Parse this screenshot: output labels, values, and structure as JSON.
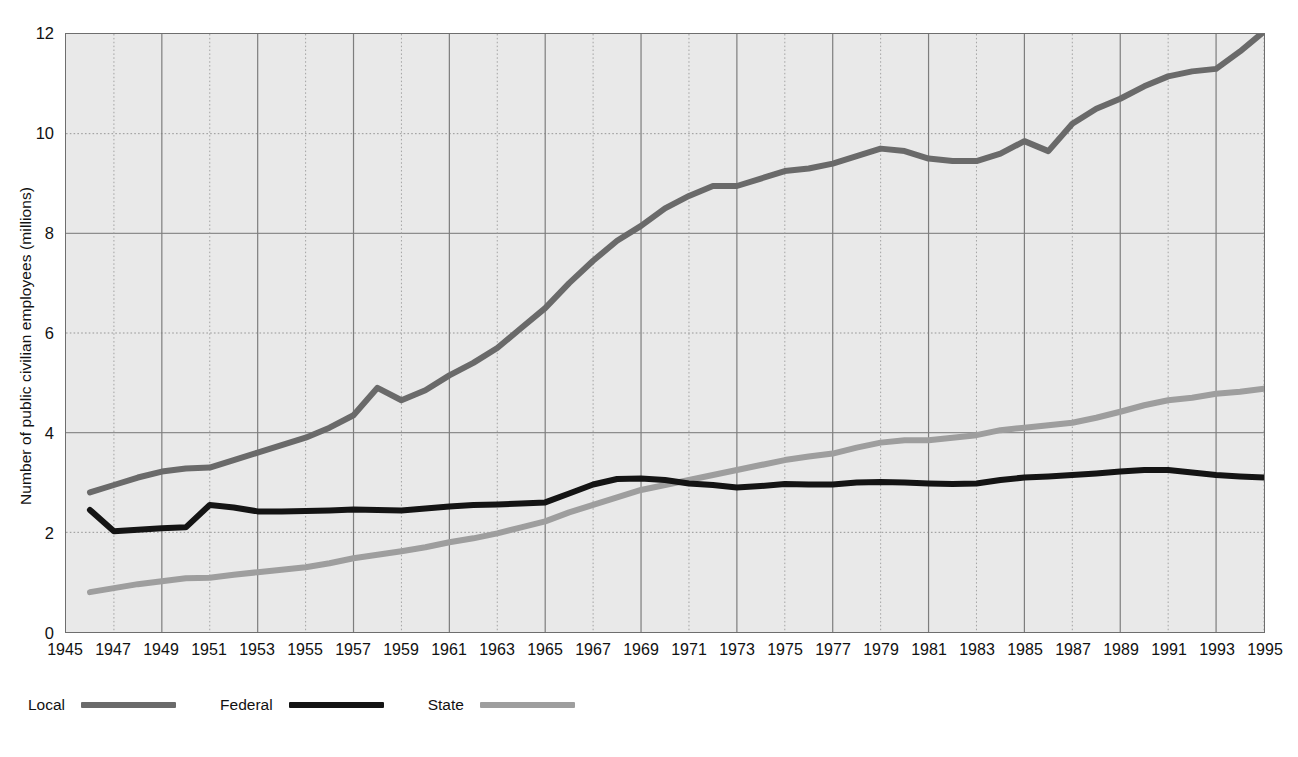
{
  "chart_data": {
    "type": "line",
    "title": "",
    "subtitle": "",
    "xlabel": "",
    "ylabel": "Number of public civilian employees (millions)",
    "xlim": [
      1945,
      1995
    ],
    "ylim": [
      0,
      12
    ],
    "y_ticks": [
      "0",
      "2",
      "4",
      "6",
      "8",
      "10",
      "12"
    ],
    "y_tick_values": [
      0,
      2,
      4,
      6,
      8,
      10,
      12
    ],
    "x_ticks": [
      "1945",
      "1947",
      "1949",
      "1951",
      "1953",
      "1955",
      "1957",
      "1959",
      "1961",
      "1963",
      "1965",
      "1967",
      "1969",
      "1971",
      "1973",
      "1975",
      "1977",
      "1979",
      "1981",
      "1983",
      "1985",
      "1987",
      "1989",
      "1991",
      "1993",
      "1995"
    ],
    "x_tick_values": [
      1945,
      1947,
      1949,
      1951,
      1953,
      1955,
      1957,
      1959,
      1961,
      1963,
      1965,
      1967,
      1969,
      1971,
      1973,
      1975,
      1977,
      1979,
      1981,
      1983,
      1985,
      1987,
      1989,
      1991,
      1993,
      1995
    ],
    "grid": true,
    "legend_position": "below-left",
    "x": [
      1946,
      1947,
      1948,
      1949,
      1950,
      1951,
      1952,
      1953,
      1954,
      1955,
      1956,
      1957,
      1958,
      1959,
      1960,
      1961,
      1962,
      1963,
      1964,
      1965,
      1966,
      1967,
      1968,
      1969,
      1970,
      1971,
      1972,
      1973,
      1974,
      1975,
      1976,
      1977,
      1978,
      1979,
      1980,
      1981,
      1982,
      1983,
      1984,
      1985,
      1986,
      1987,
      1988,
      1989,
      1990,
      1991,
      1992,
      1993,
      1994,
      1995
    ],
    "series": [
      {
        "name": "Local",
        "color": "#6a6a6a",
        "values": [
          2.8,
          2.95,
          3.1,
          3.22,
          3.28,
          3.3,
          3.45,
          3.6,
          3.75,
          3.9,
          4.1,
          4.35,
          4.9,
          4.65,
          4.85,
          5.15,
          5.4,
          5.7,
          6.1,
          6.5,
          7.0,
          7.45,
          7.85,
          8.15,
          8.5,
          8.75,
          8.95,
          8.95,
          9.1,
          9.25,
          9.3,
          9.4,
          9.55,
          9.7,
          9.65,
          9.5,
          9.45,
          9.45,
          9.6,
          9.85,
          9.65,
          10.2,
          10.5,
          10.7,
          10.95,
          11.15,
          11.25,
          11.3,
          11.65,
          12.05
        ]
      },
      {
        "name": "Federal",
        "color": "#141414",
        "values": [
          2.45,
          2.02,
          2.05,
          2.08,
          2.1,
          2.55,
          2.5,
          2.42,
          2.42,
          2.43,
          2.44,
          2.46,
          2.45,
          2.44,
          2.48,
          2.52,
          2.55,
          2.56,
          2.58,
          2.6,
          2.78,
          2.96,
          3.07,
          3.08,
          3.05,
          2.98,
          2.95,
          2.9,
          2.93,
          2.97,
          2.96,
          2.96,
          3.0,
          3.01,
          3.0,
          2.98,
          2.97,
          2.98,
          3.05,
          3.1,
          3.12,
          3.15,
          3.18,
          3.22,
          3.25,
          3.25,
          3.2,
          3.15,
          3.12,
          3.1
        ]
      },
      {
        "name": "State",
        "color": "#9e9e9e",
        "values": [
          0.8,
          0.88,
          0.96,
          1.02,
          1.08,
          1.09,
          1.15,
          1.2,
          1.25,
          1.3,
          1.38,
          1.48,
          1.55,
          1.62,
          1.7,
          1.8,
          1.88,
          1.98,
          2.1,
          2.22,
          2.4,
          2.55,
          2.7,
          2.85,
          2.95,
          3.05,
          3.15,
          3.25,
          3.35,
          3.45,
          3.52,
          3.58,
          3.7,
          3.8,
          3.85,
          3.85,
          3.9,
          3.95,
          4.05,
          4.1,
          4.15,
          4.2,
          4.3,
          4.42,
          4.55,
          4.65,
          4.7,
          4.78,
          4.82,
          4.88
        ]
      }
    ]
  },
  "legend": {
    "items": [
      {
        "label": "Local",
        "color": "#6a6a6a"
      },
      {
        "label": "Federal",
        "color": "#141414"
      },
      {
        "label": "State",
        "color": "#9e9e9e"
      }
    ]
  }
}
